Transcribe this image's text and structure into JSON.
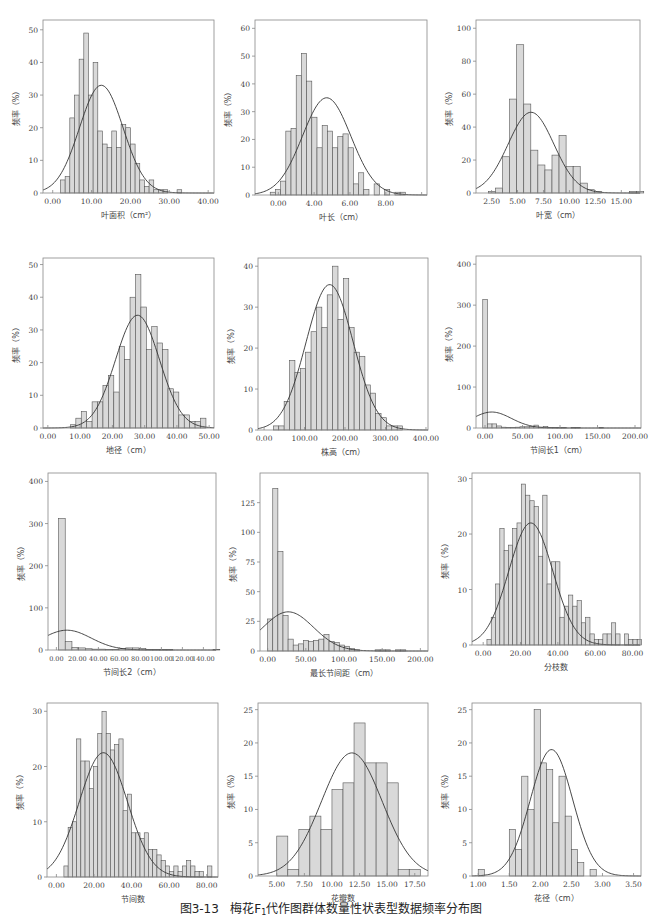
{
  "figure": {
    "caption_prefix": "图3-13",
    "caption_text_a": "梅花F",
    "caption_sub": "1",
    "caption_text_b": "代作图群体数量性状表型数据频率分布图"
  },
  "style": {
    "bar_fill": "#d9d9d9",
    "bar_stroke": "#555555",
    "frame_stroke": "#888888",
    "curve_stroke": "#333333",
    "text_color": "#444444"
  },
  "chart_data": [
    {
      "id": "leaf-area",
      "type": "bar",
      "title": "",
      "xlabel": "叶面积（cm²）",
      "ylabel": "频率（%）",
      "frame": {
        "x": 43,
        "y": 20,
        "w": 171,
        "h": 173
      },
      "xlim": [
        -2.5,
        41.5
      ],
      "ylim": [
        0,
        53
      ],
      "xticks": [
        0,
        10,
        20,
        30,
        40
      ],
      "xtick_labels": [
        "0.00",
        "10.00",
        "20.00",
        "30.00",
        "40.00"
      ],
      "yticks": [
        0,
        10,
        20,
        30,
        40,
        50
      ],
      "bin_start": 2.0,
      "bin_width": 1.2,
      "values": [
        4,
        5,
        23,
        30,
        41,
        49,
        30,
        40,
        19,
        15,
        14,
        19,
        14,
        21,
        20,
        15,
        9,
        4,
        2,
        4,
        1,
        1,
        1,
        0,
        0,
        1
      ],
      "curve": {
        "mean": 12.5,
        "sd": 5.6,
        "peak": 33
      }
    },
    {
      "id": "leaf-length",
      "type": "bar",
      "title": "",
      "xlabel": "叶长（cm）",
      "ylabel": "频率（%）",
      "frame": {
        "x": 255,
        "y": 20,
        "w": 172,
        "h": 175
      },
      "xlim": [
        -1.3,
        8.3
      ],
      "ylim": [
        0,
        63
      ],
      "xticks": [
        0,
        2,
        4,
        6,
        8
      ],
      "xtick_labels": [
        "0.00",
        "4.00",
        "6.00",
        "8.00"
      ],
      "xtick_label_positions": [
        0,
        2,
        4,
        6
      ],
      "xtick_label_note": "labels as printed: 0.00 at first tick, 4.00 at second, 6.00 at third, 8.00 at fourth",
      "yticks": [
        0,
        10,
        20,
        30,
        40,
        50,
        60
      ],
      "bin_start": -0.45,
      "bin_width": 0.29,
      "values": [
        1,
        2,
        5,
        23,
        24,
        43,
        51,
        41,
        28,
        17,
        25,
        23,
        17,
        21,
        22,
        17,
        4,
        8,
        2,
        0,
        4,
        0,
        2,
        0,
        1,
        1
      ],
      "curve": {
        "mean": 2.7,
        "sd": 1.35,
        "peak": 35
      }
    },
    {
      "id": "leaf-width",
      "type": "bar",
      "title": "",
      "xlabel": "叶宽（cm）",
      "ylabel": "频率（%）",
      "frame": {
        "x": 476,
        "y": 20,
        "w": 164,
        "h": 173
      },
      "xlim": [
        1.0,
        16.8
      ],
      "ylim": [
        0,
        105
      ],
      "xticks": [
        2.5,
        5.0,
        7.5,
        10.0,
        12.5,
        15.0
      ],
      "xtick_labels": [
        "2.50",
        "5.00",
        "7.50",
        "10.00",
        "12.50",
        "15.00"
      ],
      "yticks": [
        0,
        20,
        40,
        60,
        80,
        100
      ],
      "bin_start": 2.2,
      "bin_width": 0.68,
      "values": [
        1,
        3,
        22,
        57,
        90,
        54,
        26,
        17,
        14,
        23,
        35,
        16,
        16,
        6,
        2,
        1,
        0,
        0,
        0,
        0,
        1,
        1
      ],
      "curve": {
        "mean": 6.3,
        "sd": 2.2,
        "peak": 49
      }
    },
    {
      "id": "ground-diameter",
      "type": "bar",
      "title": "",
      "xlabel": "地径（cm）",
      "ylabel": "频率（%）",
      "frame": {
        "x": 43,
        "y": 258,
        "w": 171,
        "h": 170
      },
      "xlim": [
        -1.5,
        51.5
      ],
      "ylim": [
        0,
        52
      ],
      "xticks": [
        0,
        10,
        20,
        30,
        40,
        50
      ],
      "xtick_labels": [
        "0.00",
        "10.00",
        "20.00",
        "30.00",
        "40.00",
        "50.00"
      ],
      "yticks": [
        0,
        10,
        20,
        30,
        40,
        50
      ],
      "bin_start": 7.0,
      "bin_width": 1.68,
      "values": [
        1,
        3,
        5,
        2,
        8,
        8,
        13,
        16,
        11,
        25,
        21,
        40,
        47,
        37,
        24,
        31,
        26,
        24,
        12,
        11,
        4,
        4,
        2,
        2,
        3
      ],
      "curve": {
        "mean": 27.8,
        "sd": 6.8,
        "peak": 34.5
      }
    },
    {
      "id": "plant-height",
      "type": "bar",
      "title": "",
      "xlabel": "株高（cm）",
      "ylabel": "频率（%）",
      "frame": {
        "x": 258,
        "y": 258,
        "w": 170,
        "h": 172
      },
      "xlim": [
        -15,
        405
      ],
      "ylim": [
        0,
        42
      ],
      "xticks": [
        0,
        100,
        200,
        300,
        400
      ],
      "xtick_labels": [
        "0.00",
        "100.00",
        "200.00",
        "300.00",
        "400.00"
      ],
      "yticks": [
        0,
        10,
        20,
        30,
        40
      ],
      "bin_start": 23,
      "bin_width": 13.3,
      "values": [
        1,
        1,
        7,
        17,
        14,
        15,
        19,
        24,
        30,
        25,
        33,
        40,
        27,
        37,
        25,
        19,
        18,
        11,
        9,
        4,
        3,
        1,
        1,
        1
      ],
      "curve": {
        "mean": 162,
        "sd": 58,
        "peak": 35.5
      }
    },
    {
      "id": "internode-length-1",
      "type": "bar",
      "title": "",
      "xlabel": "节间长1（cm）",
      "ylabel": "频率（%）",
      "frame": {
        "x": 476,
        "y": 256,
        "w": 165,
        "h": 172
      },
      "xlim": [
        -12,
        208
      ],
      "ylim": [
        0,
        420
      ],
      "xticks": [
        0,
        50,
        100,
        150,
        200
      ],
      "xtick_labels": [
        "0.00",
        "50.00",
        "100.00",
        "150.00",
        "200.00"
      ],
      "yticks": [
        0,
        100,
        200,
        300,
        400
      ],
      "bin_start": -3,
      "bin_width": 6.2,
      "values": [
        314,
        10,
        10,
        5,
        2,
        1,
        1,
        2,
        3,
        3,
        4,
        7,
        2,
        4,
        1,
        1,
        1,
        1,
        0,
        1,
        1,
        0,
        0,
        0,
        0,
        1
      ],
      "curve": {
        "mean": 9,
        "sd": 26,
        "peak": 39
      }
    },
    {
      "id": "internode-length-2",
      "type": "bar",
      "title": "",
      "xlabel": "节间长2（cm）",
      "ylabel": "频率（%）",
      "frame": {
        "x": 48,
        "y": 473,
        "w": 168,
        "h": 177
      },
      "xlim": [
        -8,
        152
      ],
      "ylim": [
        0,
        420
      ],
      "xticks": [
        0,
        20,
        40,
        60,
        80,
        100,
        120,
        140
      ],
      "xtick_labels": [
        "0.00",
        "20.00",
        "40.00",
        "60.00",
        "80.00",
        "100.00",
        "120.00",
        "140.00"
      ],
      "yticks": [
        0,
        100,
        200,
        300,
        400
      ],
      "bin_start": 2,
      "bin_width": 6.4,
      "values": [
        312,
        20,
        6,
        5,
        3,
        2,
        2,
        1,
        1,
        4,
        5,
        5,
        4,
        1,
        1,
        1,
        1,
        0,
        0,
        0,
        0,
        0,
        0,
        1
      ],
      "curve": {
        "mean": 10,
        "sd": 23,
        "peak": 47
      }
    },
    {
      "id": "longest-internode",
      "type": "bar",
      "title": "",
      "xlabel": "最长节间距（cm）",
      "ylabel": "频率（%）",
      "frame": {
        "x": 260,
        "y": 473,
        "w": 168,
        "h": 178
      },
      "xlim": [
        -10,
        210
      ],
      "ylim": [
        0,
        150
      ],
      "xticks": [
        0,
        50,
        100,
        150,
        200
      ],
      "xtick_labels": [
        "0.00",
        "50.00",
        "100.00",
        "150.00",
        "200.00"
      ],
      "yticks": [
        0,
        25,
        50,
        75,
        100,
        125
      ],
      "bin_start": 0,
      "bin_width": 6.7,
      "values": [
        27,
        137,
        84,
        30,
        10,
        5,
        6,
        9,
        8,
        9,
        10,
        14,
        8,
        7,
        5,
        4,
        2,
        1,
        0,
        0,
        0,
        1,
        1,
        1,
        0,
        1,
        1
      ],
      "curve": {
        "mean": 27,
        "sd": 33,
        "peak": 33
      }
    },
    {
      "id": "branch-number",
      "type": "bar",
      "title": "",
      "xlabel": "分枝数",
      "ylabel": "频率（%）",
      "frame": {
        "x": 472,
        "y": 473,
        "w": 168,
        "h": 172
      },
      "xlim": [
        -6,
        84
      ],
      "ylim": [
        0,
        31
      ],
      "xticks": [
        0,
        20,
        40,
        60,
        80
      ],
      "xtick_labels": [
        "0.00",
        "20.00",
        "40.00",
        "60.00",
        "80.00"
      ],
      "yticks": [
        0,
        10,
        20,
        30
      ],
      "bin_start": 2,
      "bin_width": 2.3,
      "values": [
        1,
        5,
        11,
        21,
        17,
        18,
        21,
        22,
        29,
        27,
        26,
        25,
        16,
        27,
        11,
        15,
        15,
        5,
        7,
        9,
        7,
        8,
        4,
        5,
        2,
        1,
        1,
        2,
        2,
        4,
        2,
        0,
        2,
        1,
        1,
        1
      ],
      "curve": {
        "mean": 25.5,
        "sd": 11.8,
        "peak": 22
      }
    },
    {
      "id": "node-number",
      "type": "bar",
      "title": "",
      "xlabel": "节间数",
      "ylabel": "频率（%）",
      "frame": {
        "x": 47,
        "y": 703,
        "w": 171,
        "h": 174
      },
      "xlim": [
        -5,
        86
      ],
      "ylim": [
        0,
        31.5
      ],
      "xticks": [
        0,
        20,
        40,
        60,
        80
      ],
      "xtick_labels": [
        "0.00",
        "20.00",
        "40.00",
        "60.00",
        "80.00"
      ],
      "yticks": [
        0,
        10,
        20,
        30
      ],
      "bin_start": 4,
      "bin_width": 2.25,
      "values": [
        2,
        9,
        10,
        25,
        21,
        21,
        16,
        20,
        26,
        30,
        26,
        23,
        24,
        25,
        12,
        15,
        8,
        8,
        7,
        8,
        5,
        5,
        4,
        3,
        2,
        1,
        2,
        1,
        2,
        3,
        2,
        1,
        1,
        0,
        2
      ],
      "curve": {
        "mean": 25,
        "sd": 12.8,
        "peak": 22.5
      }
    },
    {
      "id": "petal-number",
      "type": "bar",
      "title": "",
      "xlabel": "花瓣数",
      "ylabel": "频率（%）",
      "frame": {
        "x": 258,
        "y": 703,
        "w": 170,
        "h": 173
      },
      "xlim": [
        3.3,
        18.7
      ],
      "ylim": [
        0,
        26
      ],
      "xticks": [
        5,
        7.5,
        10,
        12.5,
        15,
        17.5
      ],
      "xtick_labels": [
        "5.00",
        "7.50",
        "10.00",
        "12.50",
        "15.00",
        "17.50"
      ],
      "yticks": [
        0,
        5,
        10,
        15,
        20,
        25
      ],
      "bin_start": 5,
      "bin_width": 1.0,
      "values": [
        6,
        1,
        7,
        9,
        7,
        13,
        14,
        23,
        17,
        17,
        14,
        1,
        1
      ],
      "curve": {
        "mean": 11.8,
        "sd": 2.75,
        "peak": 18.5
      }
    },
    {
      "id": "flower-diameter",
      "type": "bar",
      "title": "",
      "xlabel": "花径（cm）",
      "ylabel": "频率（%）",
      "frame": {
        "x": 472,
        "y": 703,
        "w": 169,
        "h": 173
      },
      "xlim": [
        0.9,
        3.62
      ],
      "ylim": [
        0,
        26
      ],
      "xticks": [
        1.0,
        1.5,
        2.0,
        2.5,
        3.0,
        3.5
      ],
      "xtick_labels": [
        "1.00",
        "1.50",
        "2.00",
        "2.50",
        "3.00",
        "3.50"
      ],
      "yticks": [
        0,
        5,
        10,
        15,
        20,
        25
      ],
      "bin_start": 1.0,
      "bin_width": 0.1,
      "values": [
        1,
        0,
        0,
        0,
        0,
        7,
        4,
        15,
        10,
        25,
        17,
        16,
        8,
        15,
        9,
        4,
        2,
        0,
        1
      ],
      "curve": {
        "mean": 2.18,
        "sd": 0.34,
        "peak": 19
      }
    }
  ]
}
